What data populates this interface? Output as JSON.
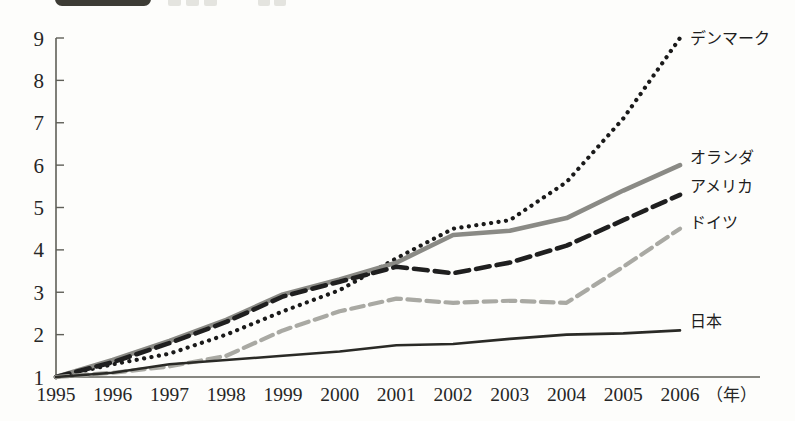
{
  "header": {
    "chip_label": "",
    "note": "cropped header bar"
  },
  "axis": {
    "y_ticks": [
      "9",
      "8",
      "7",
      "6",
      "5",
      "4",
      "3",
      "2",
      "1"
    ],
    "x_ticks": [
      "1995",
      "1996",
      "1997",
      "1998",
      "1999",
      "2000",
      "2001",
      "2002",
      "2003",
      "2004",
      "2005",
      "2006"
    ],
    "x_unit": "（年）"
  },
  "labels": {
    "denmark": "デンマーク",
    "netherlands": "オランダ",
    "america": "アメリカ",
    "germany": "ドイツ",
    "japan": "日本"
  },
  "colors": {
    "background": "#fdfdfb",
    "axis": "#5f5f58",
    "text": "#262626",
    "denmark": "#1a1a1a",
    "netherlands": "#8a8a85",
    "america": "#1f1f1f",
    "germany": "#a9a9a3",
    "japan": "#2a2a26"
  },
  "chart_data": {
    "type": "line",
    "title": "",
    "subtitle": "",
    "xlabel": "（年）",
    "ylabel": "",
    "x": [
      1995,
      1996,
      1997,
      1998,
      1999,
      2000,
      2001,
      2002,
      2003,
      2004,
      2005,
      2006
    ],
    "categories": [
      "1995",
      "1996",
      "1997",
      "1998",
      "1999",
      "2000",
      "2001",
      "2002",
      "2003",
      "2004",
      "2005",
      "2006"
    ],
    "xlim": [
      1995,
      2006
    ],
    "ylim": [
      1,
      9
    ],
    "y_ticks": [
      1,
      2,
      3,
      4,
      5,
      6,
      7,
      8,
      9
    ],
    "grid": false,
    "legend": "inline-right-end-labels",
    "series": [
      {
        "name": "デンマーク",
        "label_en": "Denmark",
        "style": "dotted",
        "color": "#1a1a1a",
        "width": 4.2,
        "values": [
          1.0,
          1.3,
          1.55,
          2.0,
          2.55,
          3.05,
          3.8,
          4.5,
          4.7,
          5.6,
          7.1,
          9.0
        ]
      },
      {
        "name": "オランダ",
        "label_en": "Netherlands",
        "style": "solid",
        "color": "#8a8a85",
        "width": 4.6,
        "values": [
          1.0,
          1.4,
          1.85,
          2.35,
          2.95,
          3.3,
          3.7,
          4.35,
          4.45,
          4.75,
          5.4,
          6.0
        ]
      },
      {
        "name": "アメリカ",
        "label_en": "America",
        "style": "dashed",
        "color": "#1f1f1f",
        "width": 4.6,
        "values": [
          1.0,
          1.35,
          1.8,
          2.3,
          2.9,
          3.25,
          3.6,
          3.45,
          3.7,
          4.1,
          4.7,
          5.3
        ]
      },
      {
        "name": "ドイツ",
        "label_en": "Germany",
        "style": "dashed",
        "color": "#a9a9a3",
        "width": 4.2,
        "values": [
          1.0,
          1.1,
          1.25,
          1.5,
          2.1,
          2.55,
          2.85,
          2.75,
          2.8,
          2.75,
          3.6,
          4.5
        ]
      },
      {
        "name": "日本",
        "label_en": "Japan",
        "style": "solid",
        "color": "#2a2a26",
        "width": 2.6,
        "values": [
          1.0,
          1.1,
          1.3,
          1.4,
          1.5,
          1.6,
          1.75,
          1.78,
          1.9,
          2.0,
          2.03,
          2.1
        ]
      }
    ]
  },
  "plot_geometry": {
    "x_start_px": 56,
    "x_end_px": 680,
    "y_top_px": 38,
    "y_bottom_px": 377
  },
  "series_end_labels": [
    {
      "key": "denmark",
      "x_px": 690,
      "y_px": 44
    },
    {
      "key": "netherlands",
      "x_px": 690,
      "y_px": 163
    },
    {
      "key": "america",
      "x_px": 690,
      "y_px": 192
    },
    {
      "key": "germany",
      "x_px": 690,
      "y_px": 228
    },
    {
      "key": "japan",
      "x_px": 690,
      "y_px": 327
    }
  ]
}
